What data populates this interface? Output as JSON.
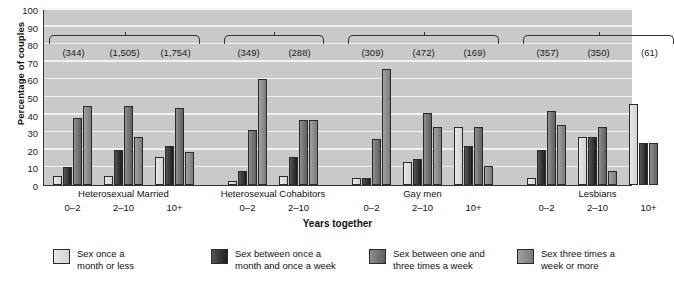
{
  "chart_data": {
    "type": "bar",
    "title": "",
    "xlabel": "Years together",
    "ylabel": "Percentage of couples",
    "ylim": [
      0,
      100
    ],
    "yticks": [
      0,
      10,
      20,
      30,
      40,
      50,
      60,
      70,
      80,
      90,
      100
    ],
    "grid": true,
    "legend_position": "bottom",
    "categories": [
      "Heterosexual Married 0–2",
      "Heterosexual Married 2–10",
      "Heterosexual Married 10+",
      "Heterosexual Cohabitors 0–2",
      "Heterosexual Cohabitors 2–10",
      "Gay men 0–2",
      "Gay men 2–10",
      "Gay men 10+",
      "Lesbians 0–2",
      "Lesbians 2–10",
      "Lesbians 10+"
    ],
    "series": [
      {
        "name": "Sex once a month or less",
        "values": [
          5,
          5,
          16,
          2,
          5,
          4,
          13,
          33,
          4,
          27,
          46
        ]
      },
      {
        "name": "Sex between once a month and once a week",
        "values": [
          10,
          20,
          22,
          8,
          16,
          4,
          15,
          22,
          20,
          27,
          24
        ]
      },
      {
        "name": "Sex between one and three times a week",
        "values": [
          38,
          45,
          44,
          31,
          37,
          26,
          41,
          33,
          42,
          33,
          24
        ]
      },
      {
        "name": "Sex three times a week or more",
        "values": [
          45,
          27,
          19,
          60,
          37,
          66,
          33,
          11,
          34,
          8,
          0
        ]
      }
    ],
    "group_labels": [
      "Heterosexual Married",
      "Heterosexual Cohabitors",
      "Gay men",
      "Lesbians"
    ],
    "tick_labels": [
      "0–2",
      "2–10",
      "10+",
      "0–2",
      "2–10",
      "0–2",
      "2–10",
      "10+",
      "0–2",
      "2–10",
      "10+"
    ],
    "sample_sizes": [
      "(344)",
      "(1,505)",
      "(1,754)",
      "(349)",
      "(288)",
      "(309)",
      "(472)",
      "(169)",
      "(357)",
      "(350)",
      "(61)"
    ],
    "colors": [
      "#e0e0e0",
      "#242424",
      "#6e6e6e",
      "#8e8e8e"
    ],
    "plot_background": "#c9c9c9"
  },
  "axes": {
    "ylabel": "Percentage of couples",
    "xlabel": "Years together",
    "yticks": [
      "100",
      "90",
      "80",
      "70",
      "60",
      "50",
      "40",
      "30",
      "20",
      "10",
      "0"
    ]
  },
  "legend": {
    "items": [
      {
        "label": "Sex once a\nmonth or less"
      },
      {
        "label": "Sex between once a\nmonth and once a week"
      },
      {
        "label": "Sex between one and\nthree times a week"
      },
      {
        "label": "Sex three times a\nweek or more"
      }
    ]
  },
  "groups": [
    {
      "label": "Heterosexual Married",
      "ticks": [
        "0–2",
        "2–10",
        "10+"
      ]
    },
    {
      "label": "Heterosexual Cohabitors",
      "ticks": [
        "0–2",
        "2–10"
      ]
    },
    {
      "label": "Gay men",
      "ticks": [
        "0–2",
        "2–10",
        "10+"
      ]
    },
    {
      "label": "Lesbians",
      "ticks": [
        "0–2",
        "2–10",
        "10+"
      ]
    }
  ],
  "sample_sizes": [
    "(344)",
    "(1,505)",
    "(1,754)",
    "(349)",
    "(288)",
    "(309)",
    "(472)",
    "(169)",
    "(357)",
    "(350)",
    "(61)"
  ]
}
